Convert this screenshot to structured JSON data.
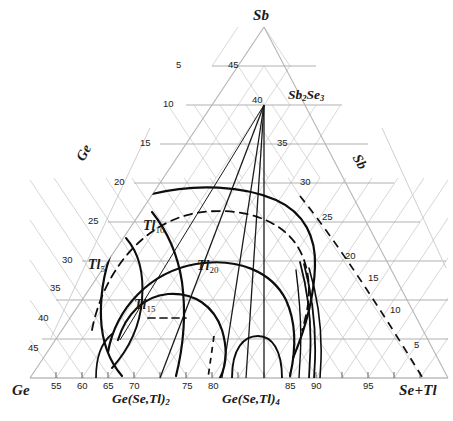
{
  "figure": {
    "type": "ternary-phase-diagram",
    "title": "",
    "background": "#ffffff",
    "grid_color": "#b9b9b9",
    "grid_light_color": "#cfcfcf",
    "curve_color": "#111111"
  },
  "apexes": {
    "top": "Sb",
    "bottom_left": "Ge",
    "bottom_right": "Se+Tl"
  },
  "axis_side_labels": {
    "left": "Ge",
    "right": "Sb"
  },
  "compounds": [
    {
      "name": "Sb2Se3",
      "html": "Sb<sub>2</sub>Se<sub>3</sub>",
      "x": 288,
      "y": 88
    },
    {
      "name": "Ge(Se,Tl)2",
      "html": "Ge(Se,Tl)<sub>2</sub>",
      "x": 112,
      "y": 394
    },
    {
      "name": "Ge(Se,Tl)4",
      "html": "Ge(Se,Tl)<sub>4</sub>",
      "x": 222,
      "y": 394
    }
  ],
  "isopleths": [
    {
      "label": "Tl5",
      "html": "Tl<sub>5</sub>",
      "x": 88,
      "y": 262
    },
    {
      "label": "Tl10",
      "html": "Tl<sub>10</sub>",
      "x": 142,
      "y": 222
    },
    {
      "label": "Tl15",
      "html": "Tl<sub>15</sub>",
      "x": 134,
      "y": 300
    },
    {
      "label": "Tl20",
      "html": "Tl<sub>20</sub>",
      "x": 196,
      "y": 262
    }
  ],
  "ticks": {
    "left": [
      "5",
      "10",
      "15",
      "20",
      "25",
      "30",
      "35",
      "40",
      "45"
    ],
    "right": [
      "45",
      "35",
      "30",
      "25",
      "20",
      "15",
      "10",
      "5"
    ],
    "bottom": [
      "55",
      "60",
      "65",
      "70",
      "75",
      "80",
      "85",
      "90",
      "95"
    ],
    "apex_value": "40"
  },
  "chart_data": {
    "type": "line",
    "xlabel": "Ge / Se+Tl",
    "ylabel": "Sb",
    "grid": true,
    "legend": "none",
    "axis_ranges": {
      "left": [
        5,
        45
      ],
      "right": [
        5,
        45
      ],
      "bottom": [
        55,
        95
      ]
    },
    "series": [
      {
        "name": "Tl5",
        "style": "solid",
        "note": "glass-forming boundary, 5 at.% Tl"
      },
      {
        "name": "Tl10",
        "style": "solid",
        "note": "glass-forming boundary, 10 at.% Tl"
      },
      {
        "name": "Tl15",
        "style": "solid",
        "note": "glass-forming boundary, 15 at.% Tl"
      },
      {
        "name": "Tl20",
        "style": "solid",
        "note": "glass-forming boundary, 20 at.% Tl"
      },
      {
        "name": "dashed-boundary",
        "style": "dashed",
        "note": "auxiliary dashed contour"
      }
    ]
  }
}
